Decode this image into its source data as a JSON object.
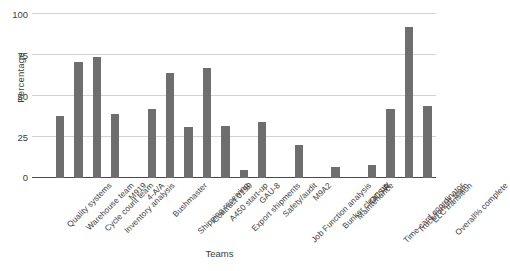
{
  "chart_data": {
    "type": "bar",
    "title": "",
    "xlabel": "Teams",
    "ylabel": "Percentage",
    "ylim": [
      0,
      100
    ],
    "yticks": [
      0,
      25,
      50,
      75,
      100
    ],
    "grid": true,
    "legend": "none",
    "bar_color": "#6e6e6e",
    "categories": [
      "Quality systems",
      "Warehouse team",
      "Cycle count team",
      "Inventory analysis",
      "M919",
      "4-A/A",
      "Bushmaster",
      "Shipping receiving",
      "Contract 0199",
      "A450 start-up",
      "Export shipments",
      "GAU-8",
      "Safety/audit",
      "Job Function analysis",
      "M9A2",
      "Bunker clean-up",
      "Maintenance",
      "OCSW",
      "Time card coordinator",
      "Truck/forklift team",
      "ELC transition",
      "Overall% complete"
    ],
    "values": [
      38,
      71,
      74,
      39,
      null,
      42,
      64,
      31,
      67,
      32,
      5,
      34,
      null,
      20,
      null,
      7,
      null,
      8,
      42,
      92,
      44,
      null
    ],
    "values_note": "Bars are drawn offset to the right of their tick label; empty slots have no bar."
  },
  "axis": {
    "y_tick_labels": [
      "100",
      "75",
      "50",
      "25",
      "0"
    ],
    "y_title": "Percentage",
    "x_title": "Teams"
  }
}
